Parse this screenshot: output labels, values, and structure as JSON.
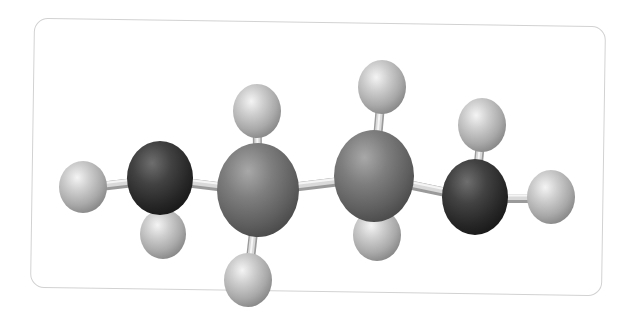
{
  "figure": {
    "title": "Butane ball-and-stick model",
    "molecule": "butane",
    "formula": "C4H10",
    "frame": {
      "border_color": "#d2d2d2",
      "background": "#ffffff"
    },
    "colors": {
      "carbon_end": "#3a3a3a",
      "carbon_middle": "#7a7a7a",
      "hydrogen": "#bdbdbd",
      "bond": "#d9d9d9",
      "bond_shadow": "#9a9a9a"
    },
    "atoms": [
      {
        "id": "H1",
        "element": "H",
        "role": "hydrogen",
        "cx": 83,
        "cy": 187,
        "rx": 24,
        "ry": 26
      },
      {
        "id": "H2",
        "element": "H",
        "role": "hydrogen",
        "cx": 163,
        "cy": 234,
        "rx": 23,
        "ry": 25
      },
      {
        "id": "H3",
        "element": "H",
        "role": "hydrogen",
        "cx": 257,
        "cy": 111,
        "rx": 24,
        "ry": 27
      },
      {
        "id": "H4",
        "element": "H",
        "role": "hydrogen",
        "cx": 248,
        "cy": 280,
        "rx": 24,
        "ry": 27
      },
      {
        "id": "H5",
        "element": "H",
        "role": "hydrogen",
        "cx": 382,
        "cy": 87,
        "rx": 24,
        "ry": 27
      },
      {
        "id": "H6",
        "element": "H",
        "role": "hydrogen",
        "cx": 377,
        "cy": 235,
        "rx": 24,
        "ry": 26
      },
      {
        "id": "H7",
        "element": "H",
        "role": "hydrogen",
        "cx": 482,
        "cy": 125,
        "rx": 24,
        "ry": 27
      },
      {
        "id": "H8",
        "element": "H",
        "role": "hydrogen",
        "cx": 551,
        "cy": 197,
        "rx": 24,
        "ry": 27
      },
      {
        "id": "C1",
        "element": "C",
        "role": "carbon_end",
        "cx": 160,
        "cy": 178,
        "rx": 33,
        "ry": 37
      },
      {
        "id": "C2",
        "element": "C",
        "role": "carbon_middle",
        "cx": 258,
        "cy": 190,
        "rx": 41,
        "ry": 47
      },
      {
        "id": "C3",
        "element": "C",
        "role": "carbon_middle",
        "cx": 374,
        "cy": 176,
        "rx": 40,
        "ry": 46
      },
      {
        "id": "C4",
        "element": "C",
        "role": "carbon_end",
        "cx": 475,
        "cy": 197,
        "rx": 33,
        "ry": 38
      }
    ],
    "bonds": [
      [
        "H1",
        "C1"
      ],
      [
        "C1",
        "H2"
      ],
      [
        "C1",
        "C2"
      ],
      [
        "C2",
        "H3"
      ],
      [
        "C2",
        "H4"
      ],
      [
        "C2",
        "C3"
      ],
      [
        "C3",
        "H5"
      ],
      [
        "C3",
        "H6"
      ],
      [
        "C3",
        "C4"
      ],
      [
        "C4",
        "H7"
      ],
      [
        "C4",
        "H8"
      ]
    ]
  }
}
